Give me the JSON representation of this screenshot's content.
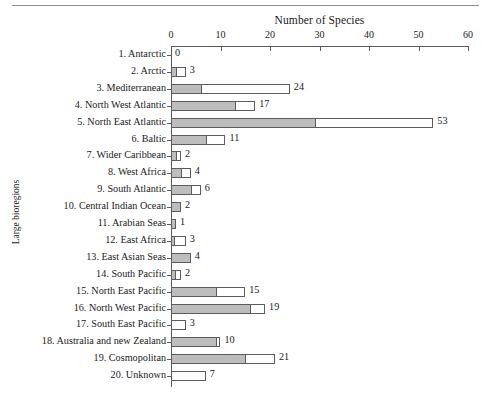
{
  "figure": {
    "axis_title": "Number of Species",
    "y_axis_label": "Large bioregions",
    "caption": "",
    "colors": {
      "gray_segment": "#bdbdbd",
      "white_segment": "#ffffff",
      "outline": "#5c5c5c",
      "axis": "#5a5a5a",
      "text": "#1a1a1a"
    }
  },
  "chart_data": {
    "type": "bar",
    "orientation": "horizontal",
    "stacked": true,
    "title": "",
    "xlabel": "Number of Species",
    "ylabel": "Large bioregions",
    "xlim": [
      0,
      60
    ],
    "xticks": [
      0,
      10,
      20,
      30,
      40,
      50,
      60
    ],
    "grid": false,
    "legend": "none",
    "categories": [
      "1. Antarctic",
      "2. Arctic",
      "3. Mediterranean",
      "4. North West Atlantic",
      "5. North East Atlantic",
      "6. Baltic",
      "7. Wider Caribbean",
      "8. West Africa",
      "9. South Atlantic",
      "10. Central Indian Ocean",
      "11. Arabian Seas",
      "12. East Africa",
      "13. East Asian Seas",
      "14. South Pacific",
      "15. North East Pacific",
      "16. North West Pacific",
      "17. South East Pacific",
      "18. Australia and new Zealand",
      "19. Cosmopolitan",
      "20. Unknown"
    ],
    "values": [
      0,
      3,
      24,
      17,
      53,
      11,
      2,
      4,
      6,
      2,
      1,
      3,
      4,
      2,
      15,
      19,
      3,
      10,
      21,
      7
    ],
    "series": [
      {
        "name": "gray segment",
        "values": [
          0,
          1,
          6,
          13,
          29,
          7,
          1,
          2,
          4,
          2,
          1,
          0.6,
          4,
          0.8,
          9,
          16,
          0,
          9,
          15,
          0
        ]
      },
      {
        "name": "white segment",
        "values": [
          0,
          2,
          18,
          4,
          24,
          4,
          1,
          2,
          2,
          0,
          0,
          2.4,
          0,
          1.2,
          6,
          3,
          3,
          1,
          6,
          7
        ]
      }
    ],
    "data_labels": [
      "0",
      "3",
      "24",
      "17",
      "53",
      "11",
      "2",
      "4",
      "6",
      "2",
      "1",
      "3",
      "4",
      "2",
      "15",
      "19",
      "3",
      "10",
      "21",
      "7"
    ]
  }
}
